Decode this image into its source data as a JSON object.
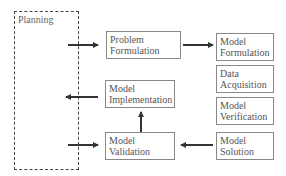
{
  "diagram": {
    "planning": {
      "label": "Planning"
    },
    "boxes": {
      "problem_formulation": {
        "line1": "Problem",
        "line2": "Formulation"
      },
      "model_formulation": {
        "line1": "Model",
        "line2": "Formulation"
      },
      "data_acquisition": {
        "line1": "Data",
        "line2": "Acquisition"
      },
      "model_verification": {
        "line1": "Model",
        "line2": "Verification"
      },
      "model_solution": {
        "line1": "Model",
        "line2": "Solution"
      },
      "model_implementation": {
        "line1": "Model",
        "line2": "Implementation"
      },
      "model_validation": {
        "line1": "Model",
        "line2": "Validation"
      }
    },
    "arrows": [
      {
        "from": "planning",
        "to": "problem_formulation",
        "direction": "right"
      },
      {
        "from": "problem_formulation",
        "to": "model_formulation",
        "direction": "right"
      },
      {
        "from": "model_implementation",
        "to": "planning",
        "direction": "left"
      },
      {
        "from": "model_validation",
        "to": "model_implementation",
        "direction": "up"
      },
      {
        "from": "planning",
        "to": "model_validation",
        "direction": "right"
      },
      {
        "from": "model_solution",
        "to": "model_validation",
        "direction": "left"
      }
    ],
    "colors": {
      "border": "#888888",
      "text": "#555555",
      "arrow": "#333333",
      "dashed": "#444444"
    }
  }
}
